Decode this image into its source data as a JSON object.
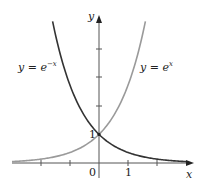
{
  "chart_data": {
    "type": "line",
    "title": "",
    "xlabel": "x",
    "ylabel": "y",
    "xlim": [
      -3,
      3.2
    ],
    "ylim": [
      0,
      5
    ],
    "grid": false,
    "tick_labels": {
      "x": [
        "0",
        "1"
      ],
      "y": [
        "1"
      ]
    },
    "x_ticks": [
      -2,
      -1,
      1,
      2
    ],
    "y_ticks": [
      1,
      2,
      3,
      4
    ],
    "series": [
      {
        "name": "y = e^{-x}",
        "label": "y = e",
        "exponent": "−x",
        "color": "#333333",
        "x": [
          -1.6,
          -1,
          -0.5,
          0,
          0.5,
          1,
          2,
          3
        ],
        "values": [
          4.95,
          2.72,
          1.65,
          1,
          0.61,
          0.37,
          0.14,
          0.05
        ]
      },
      {
        "name": "y = e^{x}",
        "label": "y = e",
        "exponent": "x",
        "color": "#9a9a9a",
        "x": [
          -3,
          -2,
          -1,
          -0.5,
          0,
          0.5,
          1,
          1.6
        ],
        "values": [
          0.05,
          0.14,
          0.37,
          0.61,
          1,
          1.65,
          2.72,
          4.95
        ]
      }
    ],
    "annotations": [
      {
        "text": "1",
        "at": [
          0,
          1
        ],
        "note": "intersection point (0,1)"
      }
    ]
  },
  "labels": {
    "x_axis": "x",
    "y_axis": "y",
    "origin": "0",
    "x_one": "1",
    "y_one": "1",
    "neg_base": "y = e",
    "neg_exp": "−x",
    "pos_base": "y = e",
    "pos_exp": "x"
  }
}
